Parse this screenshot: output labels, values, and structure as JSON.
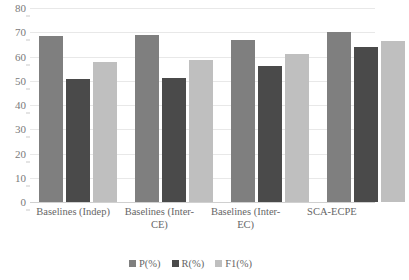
{
  "chart_data": {
    "type": "bar",
    "title": "",
    "xlabel": "",
    "ylabel": "",
    "ylim": [
      0,
      80
    ],
    "ytick_step": 10,
    "yticks": [
      80,
      70,
      60,
      50,
      40,
      30,
      20,
      10,
      0
    ],
    "grid": true,
    "legend_position": "bottom",
    "categories": [
      "Baselines (Indep)",
      "Baselines (Inter-CE)",
      "Baselines (Inter-EC)",
      "SCA-ECPE"
    ],
    "series": [
      {
        "name": "P(%)",
        "color": "#7f7f7f",
        "values": [
          68.3,
          68.8,
          66.7,
          70.0
        ]
      },
      {
        "name": "R(%)",
        "color": "#4a4a4a",
        "values": [
          50.6,
          51.0,
          56.0,
          63.8
        ]
      },
      {
        "name": "F1(%)",
        "color": "#bfbfbf",
        "values": [
          57.6,
          58.4,
          61.0,
          66.3
        ]
      }
    ]
  },
  "colors": {
    "background": "#ffffff",
    "gridline": "#e8e8e8",
    "tick_text": "#7a7a7a",
    "label_text": "#666666"
  }
}
